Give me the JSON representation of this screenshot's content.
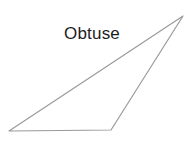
{
  "figure": {
    "label": "Obtuse",
    "label_color": "#1d1d1d",
    "background_color": "#ffffff",
    "stroke_color": "#9a9a9a",
    "stroke_width": 1.2,
    "fill": "none",
    "shape_type": "triangle",
    "shape_name": "obtuse-triangle",
    "canvas": {
      "width": 184,
      "height": 142
    },
    "vertices": [
      {
        "name": "bottom-left",
        "x": 9,
        "y": 131
      },
      {
        "name": "bottom-right",
        "x": 111,
        "y": 130
      },
      {
        "name": "apex-top-right",
        "x": 183,
        "y": 16
      }
    ],
    "points_attr": "9,131 111,130 183,16",
    "edges": [
      {
        "name": "base-edge",
        "from": "bottom-left",
        "to": "bottom-right"
      },
      {
        "name": "right-edge",
        "from": "bottom-right",
        "to": "apex-top-right"
      },
      {
        "name": "hypotenuse-edge",
        "from": "apex-top-right",
        "to": "bottom-left"
      }
    ]
  },
  "chart_data": {
    "type": "scatter",
    "title": "Obtuse",
    "xlabel": "",
    "ylabel": "",
    "x": [
      9,
      111,
      183
    ],
    "y": [
      131,
      130,
      16
    ],
    "categories": [
      "bottom-left",
      "bottom-right",
      "apex-top-right"
    ],
    "series": [
      {
        "name": "obtuse-triangle",
        "values": [
          [
            9,
            131
          ],
          [
            111,
            130
          ],
          [
            183,
            16
          ]
        ]
      }
    ],
    "xlim": [
      0,
      184
    ],
    "ylim": [
      0,
      142
    ],
    "grid": false,
    "legend": "none",
    "annotations": [
      "Obtuse"
    ]
  }
}
